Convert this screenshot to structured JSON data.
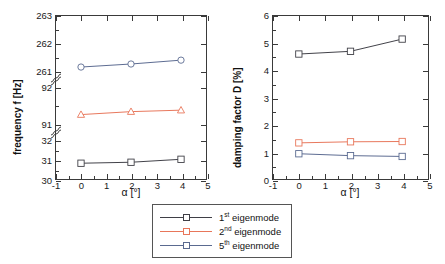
{
  "figure": {
    "series_colors": {
      "mode1": "#3f3f46",
      "mode2": "#e8765a",
      "mode5": "#5a6a90"
    },
    "legend": {
      "items": [
        {
          "label_prefix": "1",
          "label_sup": "st",
          "label_rest": " eigenmode",
          "color_key": "mode1",
          "marker": "square"
        },
        {
          "label_prefix": "2",
          "label_sup": "nd",
          "label_rest": " eigenmode",
          "color_key": "mode2",
          "marker": "square"
        },
        {
          "label_prefix": "5",
          "label_sup": "th",
          "label_rest": " eigenmode",
          "color_key": "mode5",
          "marker": "square"
        }
      ]
    }
  },
  "chart_data": [
    {
      "type": "line",
      "panel": "left",
      "title": "",
      "xlabel": "α [°]",
      "ylabel": "frequency f [Hz]",
      "x": [
        0,
        2,
        4
      ],
      "xlim": [
        -1,
        5
      ],
      "xticks": [
        -1,
        0,
        1,
        2,
        3,
        4,
        5
      ],
      "xticklabels": [
        "-1",
        "0",
        "1",
        "2",
        "3",
        "4",
        "5"
      ],
      "broken_axis": true,
      "y_segments": [
        {
          "range": [
            30,
            32
          ],
          "ticks": [
            30,
            31,
            32
          ],
          "ticklabels": [
            "30",
            "31",
            "32"
          ]
        },
        {
          "range": [
            91,
            92
          ],
          "ticks": [
            91,
            92
          ],
          "ticklabels": [
            "91",
            "92"
          ]
        },
        {
          "range": [
            261,
            263
          ],
          "ticks": [
            261,
            262,
            263
          ],
          "ticklabels": [
            "261",
            "262",
            "263"
          ]
        }
      ],
      "grid": false,
      "series": [
        {
          "name": "1st eigenmode",
          "color_key": "mode1",
          "marker": "square",
          "values": [
            30.8,
            30.85,
            31.0
          ],
          "segment": 0
        },
        {
          "name": "2nd eigenmode",
          "color_key": "mode2",
          "marker": "triangle",
          "values": [
            91.25,
            91.33,
            91.37
          ],
          "segment": 1
        },
        {
          "name": "5th eigenmode",
          "color_key": "mode5",
          "marker": "circle",
          "values": [
            261.15,
            261.26,
            261.4
          ],
          "segment": 2
        }
      ]
    },
    {
      "type": "line",
      "panel": "right",
      "title": "",
      "xlabel": "α [°]",
      "ylabel": "damping factor D [%]",
      "x": [
        0,
        2,
        4
      ],
      "xlim": [
        -1,
        5
      ],
      "xticks": [
        -1,
        0,
        1,
        2,
        3,
        4,
        5
      ],
      "xticklabels": [
        "-1",
        "0",
        "1",
        "2",
        "3",
        "4",
        "5"
      ],
      "broken_axis": false,
      "ylim": [
        0,
        6
      ],
      "yticks": [
        0,
        1,
        2,
        3,
        4,
        5,
        6
      ],
      "yticklabels": [
        "0",
        "1",
        "2",
        "3",
        "4",
        "5",
        "6"
      ],
      "grid": false,
      "series": [
        {
          "name": "1st eigenmode",
          "color_key": "mode1",
          "marker": "square",
          "values": [
            4.6,
            4.7,
            5.15
          ]
        },
        {
          "name": "2nd eigenmode",
          "color_key": "mode2",
          "marker": "square",
          "values": [
            1.33,
            1.37,
            1.38
          ]
        },
        {
          "name": "5th eigenmode",
          "color_key": "mode5",
          "marker": "square",
          "values": [
            0.93,
            0.86,
            0.83
          ]
        }
      ]
    }
  ]
}
